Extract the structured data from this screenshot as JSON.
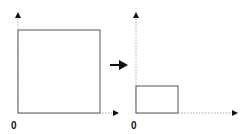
{
  "diagram": {
    "left_panel": {
      "origin_label": "0",
      "shape": "square",
      "shape_bounds": {
        "x0": 0,
        "y0": 0,
        "width": 1.0,
        "height": 1.0
      }
    },
    "transform_arrow": "right-arrow",
    "right_panel": {
      "origin_label": "0",
      "shape": "rectangle",
      "shape_bounds": {
        "x0": 0,
        "y0": 0,
        "width": 0.5,
        "height": 0.33
      }
    },
    "colors": {
      "shape_stroke": "#555555",
      "axis": "#999999",
      "arrowhead": "#111111"
    }
  }
}
